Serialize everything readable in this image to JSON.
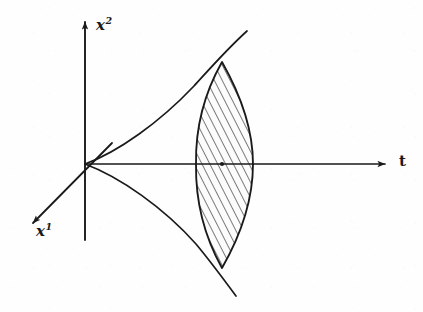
{
  "figure": {
    "type": "spacetime-light-cone-diagram",
    "background_color": "#fefefe",
    "ink_color": "#1a1a1a",
    "width": 423,
    "height": 312,
    "origin": {
      "x": 85,
      "y": 164
    },
    "axes": [
      {
        "id": "x2",
        "name": "vertical-axis",
        "base": "x",
        "superscript": "2",
        "label": "x2",
        "direction": "up",
        "arrow_tip": {
          "x": 85,
          "y": 18
        },
        "tail": {
          "x": 85,
          "y": 240
        },
        "label_pos": {
          "x": 96,
          "y": 16
        }
      },
      {
        "id": "t",
        "name": "time-axis",
        "base": "t",
        "superscript": "",
        "label": "t",
        "direction": "right",
        "arrow_tip": {
          "x": 392,
          "y": 164
        },
        "tail": {
          "x": 85,
          "y": 164
        },
        "label_pos": {
          "x": 399,
          "y": 152
        }
      },
      {
        "id": "x1",
        "name": "depth-axis",
        "base": "x",
        "superscript": "1",
        "label": "x1",
        "direction": "lower-left",
        "arrow_tip": {
          "x": 27,
          "y": 229
        },
        "tail": {
          "x": 112,
          "y": 143
        },
        "label_pos": {
          "x": 36,
          "y": 222
        }
      }
    ],
    "cone_curves": [
      {
        "id": "upper-cone-curve",
        "name": "upper-light-cone-curve",
        "description": "curve flaring upward-right from origin through lens upper tip",
        "path": "M 85 164 C 120 150 168 112 205 72 L 247 32"
      },
      {
        "id": "lower-cone-curve",
        "name": "lower-light-cone-curve",
        "description": "curve flaring downward-right from origin through lens lower tip",
        "path": "M 85 164 C 122 178 172 216 208 258 L 235 296"
      }
    ],
    "lens": {
      "id": "hatched-lens",
      "name": "hatched-lens-region",
      "center_x": 222,
      "top_tip": {
        "x": 222,
        "y": 62
      },
      "bottom_tip": {
        "x": 222,
        "y": 268
      },
      "left_extent": {
        "x": 196,
        "y": 164
      },
      "right_extent": {
        "x": 253,
        "y": 164
      },
      "fill": "#fbfbfb",
      "hatch_angle_deg": 27,
      "hatch_spacing_px": 7,
      "hatch_count": 29,
      "path": "M 222 62 C 200 100 195 135 196 164 C 195 196 202 233 222 268 C 243 232 253 196 253 164 C 253 133 244 100 222 62 Z"
    },
    "markers": [
      {
        "id": "t-axis-point",
        "name": "point-marker",
        "x": 222,
        "y": 164,
        "radius": 2.1
      }
    ]
  }
}
